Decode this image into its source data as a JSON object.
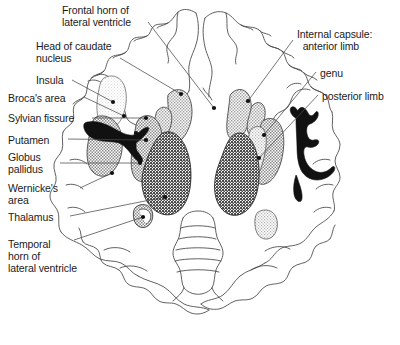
{
  "figure": {
    "type": "anatomical-diagram",
    "background_color": "#ffffff",
    "line_color": "#3c3c3c",
    "text_color": "#1a1a1a"
  },
  "labels_left": [
    {
      "id": "frontal-horn",
      "text": "Frontal horn of\nlateral ventricle",
      "x": 62,
      "y": 4
    },
    {
      "id": "head-caudate",
      "text": "Head of caudate\nnucleus",
      "x": 36,
      "y": 40
    },
    {
      "id": "insula",
      "text": "Insula",
      "x": 36,
      "y": 74
    },
    {
      "id": "brocas-area",
      "text": "Broca's area",
      "x": 8,
      "y": 92
    },
    {
      "id": "sylvian-fissure",
      "text": "Sylvian fissure",
      "x": 8,
      "y": 112
    },
    {
      "id": "putamen",
      "text": "Putamen",
      "x": 8,
      "y": 134
    },
    {
      "id": "globus-pallidus",
      "text": "Globus\npallidus",
      "x": 8,
      "y": 151
    },
    {
      "id": "wernickes-area",
      "text": "Wernicke's\narea",
      "x": 8,
      "y": 182
    },
    {
      "id": "thalamus",
      "text": "Thalamus",
      "x": 8,
      "y": 211
    },
    {
      "id": "temporal-horn",
      "text": "Temporal\nhorn of\nlateral ventricle",
      "x": 8,
      "y": 238
    }
  ],
  "labels_right": [
    {
      "id": "internal-capsule-anterior-limb",
      "text": "Internal capsule:\n  anterior limb",
      "x": 297,
      "y": 28
    },
    {
      "id": "genu",
      "text": "genu",
      "x": 320,
      "y": 67
    },
    {
      "id": "posterior-limb",
      "text": "posterior limb",
      "x": 322,
      "y": 90
    }
  ],
  "structures": [
    {
      "id": "insula-region",
      "name": "Insula",
      "shade": "#e8e8e8"
    },
    {
      "id": "caudate-head-left",
      "name": "Head of caudate nucleus (left)",
      "shade": "#b8b8b8"
    },
    {
      "id": "caudate-head-right",
      "name": "Head of caudate nucleus (right)",
      "shade": "#b8b8b8"
    },
    {
      "id": "putamen-left",
      "name": "Putamen (left)",
      "shade": "#9a9a9a"
    },
    {
      "id": "putamen-right",
      "name": "Putamen (right)",
      "shade": "#9a9a9a"
    },
    {
      "id": "globus-pallidus-left",
      "name": "Globus pallidus (left)",
      "shade": "#a8a8a8"
    },
    {
      "id": "thalamus-left",
      "name": "Thalamus (left)",
      "shade": "#6e6e6e"
    },
    {
      "id": "thalamus-right",
      "name": "Thalamus (right)",
      "shade": "#6e6e6e"
    },
    {
      "id": "sylvian-fissure-shape",
      "name": "Sylvian fissure",
      "shade": "#000000"
    },
    {
      "id": "internal-capsule-shape",
      "name": "Internal capsule",
      "shade": "#000000"
    },
    {
      "id": "temporal-horn-shape",
      "name": "Temporal horn of lateral ventricle",
      "shade": "#8f8f8f"
    },
    {
      "id": "pulvinar-right",
      "name": "Posterior thalamus / pulvinar (right)",
      "shade": "#c4c4c4"
    }
  ]
}
